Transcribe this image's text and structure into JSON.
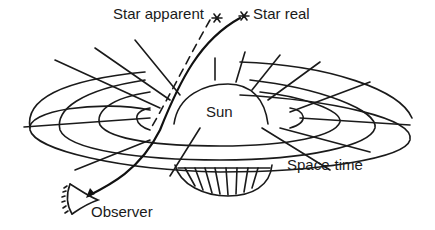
{
  "diagram": {
    "labels": {
      "star_apparent": "Star apparent",
      "star_real": "Star real",
      "sun": "Sun",
      "space_time": "Space-time",
      "observer": "Observer"
    },
    "icons": {
      "star_apparent": "star-asterisk",
      "star_real": "star-asterisk",
      "observer": "eye"
    },
    "colors": {
      "line": "#1a1a1a",
      "background": "#ffffff"
    }
  }
}
